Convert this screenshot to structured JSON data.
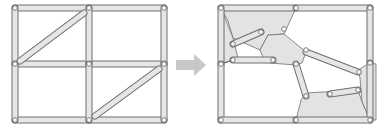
{
  "colors": {
    "bar_fill": "#e6e6e6",
    "bar_stroke": "#6e6e6e",
    "region_fill": "#e3e3e3",
    "joint_fill": "#ffffff",
    "arrow_fill": "#c8c8c8",
    "background": "#ffffff"
  },
  "left_diagram": {
    "name": "rectangular-truss-grid",
    "joints": [
      [
        15,
        8
      ],
      [
        89,
        8
      ],
      [
        164,
        8
      ],
      [
        15,
        64
      ],
      [
        89,
        64
      ],
      [
        164,
        64
      ],
      [
        15,
        120
      ],
      [
        89,
        120
      ],
      [
        164,
        120
      ]
    ],
    "bars": [
      [
        15,
        8,
        89,
        8
      ],
      [
        89,
        8,
        164,
        8
      ],
      [
        15,
        64,
        89,
        64
      ],
      [
        89,
        64,
        164,
        64
      ],
      [
        15,
        120,
        89,
        120
      ],
      [
        89,
        120,
        164,
        120
      ],
      [
        15,
        8,
        15,
        64
      ],
      [
        15,
        64,
        15,
        120
      ],
      [
        89,
        8,
        89,
        64
      ],
      [
        89,
        64,
        89,
        120
      ],
      [
        164,
        8,
        164,
        64
      ],
      [
        164,
        64,
        164,
        120
      ],
      [
        20,
        61,
        84,
        13
      ],
      [
        95,
        116,
        159,
        69
      ]
    ]
  },
  "arrow": {
    "name": "transform-arrow",
    "x": 176,
    "y": 54,
    "w": 30,
    "h": 22
  },
  "right_diagram": {
    "name": "deformed-linkage",
    "frame": {
      "x": 219,
      "y": 6,
      "w": 157,
      "h": 116
    },
    "regions": [
      [
        [
          221,
          8
        ],
        [
          296,
          8
        ],
        [
          284,
          34
        ],
        [
          268,
          35
        ],
        [
          260,
          50
        ],
        [
          233,
          38
        ],
        [
          228,
          21
        ]
      ],
      [
        [
          221,
          8
        ],
        [
          233,
          38
        ],
        [
          238,
          58
        ],
        [
          227,
          62
        ],
        [
          221,
          64
        ]
      ],
      [
        [
          268,
          35
        ],
        [
          284,
          34
        ],
        [
          306,
          52
        ],
        [
          302,
          63
        ],
        [
          296,
          65
        ],
        [
          270,
          63
        ],
        [
          264,
          60
        ],
        [
          260,
          50
        ]
      ],
      [
        [
          370,
          63
        ],
        [
          376,
          64
        ],
        [
          376,
          120
        ],
        [
          370,
          120
        ],
        [
          362,
          102
        ],
        [
          360,
          78
        ],
        [
          358,
          70
        ]
      ],
      [
        [
          306,
          93
        ],
        [
          358,
          90
        ],
        [
          362,
          102
        ],
        [
          370,
          120
        ],
        [
          296,
          120
        ],
        [
          301,
          100
        ]
      ],
      [
        [
          221,
          64
        ],
        [
          238,
          58
        ],
        [
          227,
          62
        ]
      ]
    ],
    "bars": [
      [
        221,
        8,
        296,
        8
      ],
      [
        296,
        8,
        370,
        8
      ],
      [
        221,
        8,
        221,
        64
      ],
      [
        221,
        64,
        221,
        120
      ],
      [
        370,
        8,
        370,
        63
      ],
      [
        370,
        63,
        370,
        120
      ],
      [
        221,
        120,
        296,
        120
      ],
      [
        296,
        120,
        370,
        120
      ],
      [
        233,
        44,
        261,
        32
      ],
      [
        233,
        60,
        273,
        60
      ],
      [
        306,
        52,
        358,
        72
      ],
      [
        296,
        64,
        306,
        96
      ],
      [
        330,
        94,
        358,
        90
      ]
    ],
    "joints": [
      [
        221,
        8
      ],
      [
        296,
        8
      ],
      [
        370,
        8
      ],
      [
        261,
        32
      ],
      [
        233,
        44
      ],
      [
        284,
        29
      ],
      [
        306,
        50
      ],
      [
        233,
        60
      ],
      [
        273,
        60
      ],
      [
        221,
        64
      ],
      [
        296,
        64
      ],
      [
        370,
        63
      ],
      [
        359,
        72
      ],
      [
        306,
        96
      ],
      [
        330,
        94
      ],
      [
        358,
        90
      ],
      [
        221,
        120
      ],
      [
        296,
        120
      ],
      [
        370,
        120
      ]
    ]
  }
}
